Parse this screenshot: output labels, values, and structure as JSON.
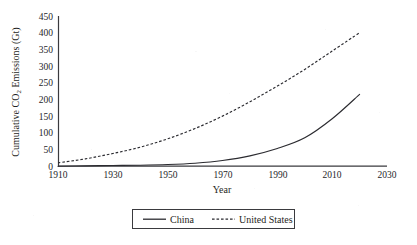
{
  "chart_data": {
    "type": "line",
    "title": "",
    "xlabel": "Year",
    "ylabel": "Cumulative CO₂ Emissions (Gt)",
    "ylabel_parts": {
      "pre": "Cumulative CO",
      "sub": "2",
      "post": " Emissions (Gt)"
    },
    "xlim": [
      1910,
      2030
    ],
    "ylim": [
      0,
      450
    ],
    "grid": false,
    "legend_position": "bottom-center",
    "x_ticks": [
      "1910",
      "1930",
      "1950",
      "1970",
      "1990",
      "2010",
      "2030"
    ],
    "y_ticks": [
      "0",
      "50",
      "100",
      "150",
      "200",
      "250",
      "300",
      "350",
      "400",
      "450"
    ],
    "x": [
      1910,
      1920,
      1930,
      1940,
      1950,
      1960,
      1970,
      1980,
      1990,
      2000,
      2010,
      2020
    ],
    "series": [
      {
        "name": "China",
        "style": "solid",
        "color": "#2b2b30",
        "values": [
          0,
          1,
          2,
          3,
          5,
          9,
          17,
          31,
          53,
          85,
          142,
          215
        ]
      },
      {
        "name": "United States",
        "style": "dashed",
        "color": "#2b2b30",
        "values": [
          10,
          22,
          38,
          57,
          82,
          113,
          150,
          193,
          240,
          290,
          345,
          400
        ]
      }
    ]
  },
  "legend": {
    "items": [
      {
        "label": "China",
        "style": "solid"
      },
      {
        "label": "United States",
        "style": "dashed"
      }
    ]
  },
  "colors": {
    "ink": "#2b2b30",
    "axis": "#3a3a3e",
    "background": "#ffffff"
  }
}
